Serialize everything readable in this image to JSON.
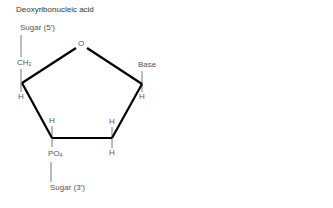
{
  "title": "Deoxyribonucleic acid",
  "labels": {
    "sugar_5": "Sugar (5′)",
    "ch2_main": "CH",
    "ch2_sub": "2",
    "ring_oxygen": "O",
    "base": "Base",
    "h_left": "H",
    "h_right": "H",
    "h_bottom_left_top": "H",
    "h_bottom_right_top": "H",
    "h_bottom_right_bottom": "H",
    "po4_main": "PO",
    "po4_sub": "4",
    "sugar_3": "Sugar (3′)"
  },
  "colors": {
    "bond": "#000000",
    "connector": "#555555",
    "text": "#555555"
  }
}
